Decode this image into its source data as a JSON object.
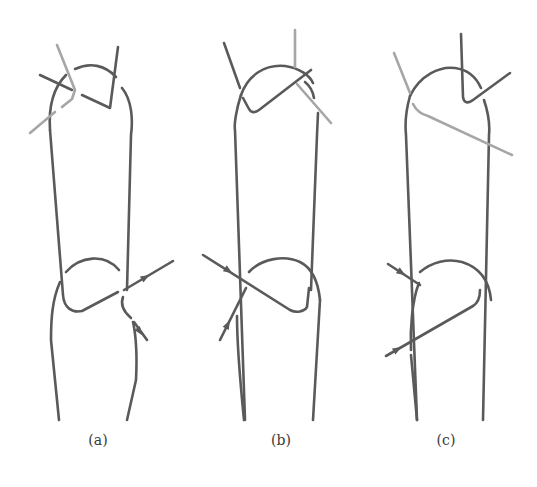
{
  "figure": {
    "colors": {
      "background": "#ffffff",
      "wire_dark": "#5a5a5a",
      "wire_light": "#a6a6a6",
      "caption": "#3a3a3a"
    },
    "stroke_width": 2.6,
    "panels": [
      {
        "id": "a",
        "caption": "(a)",
        "caption_x": 98,
        "paths": [
          {
            "name": "upper-link-left-side",
            "tone": "dark",
            "d": "M 50 130 C 48 100 56 85 66 75"
          },
          {
            "name": "upper-link-arc",
            "tone": "dark",
            "d": "M 75 69 C 90 62 105 65 116 77"
          },
          {
            "name": "upper-link-right-side",
            "tone": "dark",
            "d": "M 122 88 C 132 100 133 120 131 135 L 127 290"
          },
          {
            "name": "upper-link-left-leg",
            "tone": "dark",
            "d": "M 50 130 L 63 295 C 64 308 72 313 82 311 L 118 292"
          },
          {
            "name": "upper-link-right-hook",
            "tone": "dark",
            "d": "M 123 297 C 120 305 124 312 131 318"
          },
          {
            "name": "upper-tie-dark-1",
            "tone": "dark",
            "d": "M 40 75 L 72 90"
          },
          {
            "name": "upper-tie-dark-2",
            "tone": "dark",
            "d": "M 82 95 L 110 108 L 118 47"
          },
          {
            "name": "upper-tie-light",
            "tone": "light",
            "d": "M 57 45 L 75 90 L 72 99 L 62 107"
          },
          {
            "name": "upper-tie-light-tail",
            "tone": "light",
            "d": "M 55 112 L 30 133"
          },
          {
            "name": "lower-link-arc",
            "tone": "dark",
            "d": "M 66 272 C 80 256 105 253 119 270"
          },
          {
            "name": "lower-link-left-side",
            "tone": "dark",
            "d": "M 60 282 C 52 300 51 320 51 340 L 59 420"
          },
          {
            "name": "lower-link-right-side",
            "tone": "dark",
            "d": "M 133 322 C 137 340 137 360 136 380 L 127 420"
          },
          {
            "name": "lower-tie-arrow-wire",
            "tone": "dark",
            "d": "M 124 290 L 173 261"
          },
          {
            "name": "lower-tie-lower-wire",
            "tone": "dark",
            "d": "M 134 322 L 147 340"
          }
        ],
        "arrows": [
          {
            "name": "arrowhead-upper",
            "x": 146,
            "y": 277,
            "angle": -30
          },
          {
            "name": "arrowhead-lower",
            "x": 140,
            "y": 332,
            "angle": 54
          }
        ]
      },
      {
        "id": "b",
        "caption": "(b)",
        "caption_x": 281,
        "paths": [
          {
            "name": "upper-link-arc",
            "tone": "dark",
            "d": "M 241 95 C 248 75 265 64 285 66 C 300 68 310 76 313 83"
          },
          {
            "name": "upper-link-arc-right",
            "tone": "dark",
            "d": "M 305 82 C 310 86 313 92 314 98"
          },
          {
            "name": "upper-link-left-side",
            "tone": "dark",
            "d": "M 241 95 C 236 110 234 125 235 130 L 245 420"
          },
          {
            "name": "upper-link-right-side",
            "tone": "dark",
            "d": "M 318 113 L 317 135 L 311 290"
          },
          {
            "name": "upper-tie-dark-left",
            "tone": "dark",
            "d": "M 224 43 L 240 88"
          },
          {
            "name": "upper-tie-dark-bend",
            "tone": "dark",
            "d": "M 243 98 L 249 109 C 251 113 255 113 259 110 L 311 70"
          },
          {
            "name": "upper-tie-light-vertical",
            "tone": "light",
            "d": "M 295 30 L 295 67"
          },
          {
            "name": "upper-tie-light-diagonal",
            "tone": "light",
            "d": "M 297 84 L 331 123"
          },
          {
            "name": "lower-link-arc",
            "tone": "dark",
            "d": "M 249 272 C 262 258 285 255 300 262 C 312 268 318 280 320 300"
          },
          {
            "name": "lower-link-right-side",
            "tone": "dark",
            "d": "M 320 300 L 313 420"
          },
          {
            "name": "lower-link-left-side",
            "tone": "dark",
            "d": "M 237 316 C 237 330 238 360 244 420"
          },
          {
            "name": "lower-tie-diagonal",
            "tone": "dark",
            "d": "M 203 255 L 290 310 C 296 313 304 312 307 307 L 309 288"
          },
          {
            "name": "lower-tie-arrow-wire",
            "tone": "dark",
            "d": "M 220 340 L 246 288"
          }
        ],
        "arrows": [
          {
            "name": "arrowhead-upper",
            "x": 229,
            "y": 271,
            "angle": 33
          },
          {
            "name": "arrowhead-lower",
            "x": 228,
            "y": 324,
            "angle": -63
          }
        ]
      },
      {
        "id": "c",
        "caption": "(c)",
        "caption_x": 446,
        "paths": [
          {
            "name": "upper-link-arc",
            "tone": "dark",
            "d": "M 410 96 C 420 75 440 66 455 68 C 470 70 477 79 481 88"
          },
          {
            "name": "upper-link-left-side",
            "tone": "dark",
            "d": "M 410 96 C 406 110 405 125 406 135 L 417 420"
          },
          {
            "name": "upper-link-right-side",
            "tone": "dark",
            "d": "M 484 100 C 489 115 490 125 489 135 L 483 420"
          },
          {
            "name": "upper-tie-dark-hook",
            "tone": "dark",
            "d": "M 461 34 L 463 97 C 464 103 468 104 473 100 L 510 73"
          },
          {
            "name": "upper-tie-light-left",
            "tone": "light",
            "d": "M 394 53 L 410 93"
          },
          {
            "name": "upper-tie-light-diagonal",
            "tone": "light",
            "d": "M 413 104 C 416 110 420 114 428 116 L 512 155"
          },
          {
            "name": "lower-link-arc",
            "tone": "dark",
            "d": "M 420 272 C 432 262 448 258 462 262 C 478 267 489 278 491 300"
          },
          {
            "name": "lower-link-left-side",
            "tone": "dark",
            "d": "M 419 283 C 412 300 410 330 411 350"
          },
          {
            "name": "lower-link-left-bottom",
            "tone": "dark",
            "d": "M 411 355 L 417 420"
          },
          {
            "name": "lower-tie-short-arrow",
            "tone": "dark",
            "d": "M 388 264 L 420 285"
          },
          {
            "name": "lower-tie-long-arrow",
            "tone": "dark",
            "d": "M 386 356 L 473 306 C 478 303 480 298 480 290"
          }
        ],
        "arrows": [
          {
            "name": "arrowhead-upper",
            "x": 402,
            "y": 273,
            "angle": 33
          },
          {
            "name": "arrowhead-lower",
            "x": 398,
            "y": 349,
            "angle": -30
          }
        ]
      }
    ]
  }
}
